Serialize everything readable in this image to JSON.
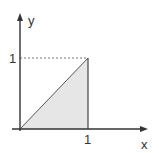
{
  "diagram": {
    "type": "coordinate-plot",
    "axes": {
      "x_label": "x",
      "y_label": "y",
      "x_tick": "1",
      "y_tick": "1"
    },
    "shape": {
      "kind": "triangle",
      "vertices": [
        [
          0,
          0
        ],
        [
          1,
          1
        ],
        [
          1,
          0
        ]
      ],
      "fill": "#e6e6e6",
      "stroke": "#444444"
    },
    "guide": {
      "kind": "dashed-line",
      "from": [
        0,
        1
      ],
      "to": [
        1,
        1
      ]
    },
    "colors": {
      "axis": "#333333",
      "fill": "#e6e6e6",
      "dashed": "#777777"
    }
  }
}
